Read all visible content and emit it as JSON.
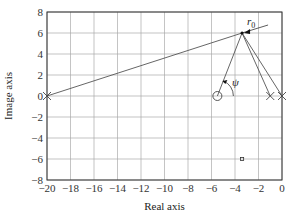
{
  "chart_data": {
    "type": "scatter",
    "title": "",
    "xlabel": "Real axis",
    "ylabel": "Image axis",
    "xlim": [
      -20,
      0
    ],
    "ylim": [
      -8,
      8
    ],
    "grid": true,
    "x_ticks": [
      "-20",
      "-18",
      "-16",
      "-14",
      "-12",
      "-10",
      "-8",
      "-6",
      "-4",
      "-2",
      "0"
    ],
    "y_ticks": [
      "8",
      "6",
      "4",
      "2",
      "0",
      "-2",
      "-4",
      "-6",
      "-8"
    ],
    "poles": [
      {
        "x": -20,
        "y": 0
      },
      {
        "x": -1,
        "y": 0
      },
      {
        "x": 0,
        "y": 0
      }
    ],
    "zeros": [
      {
        "x": -5.5,
        "y": 0
      }
    ],
    "test_point": {
      "x": -3.4,
      "y": 6,
      "label": "r0"
    },
    "conjugate_point": {
      "x": -3.4,
      "y": -6
    },
    "angle_label": "ψ",
    "vectors_from": [
      {
        "x": -20,
        "y": 0
      },
      {
        "x": -5.5,
        "y": 0
      },
      {
        "x": -1,
        "y": 0
      },
      {
        "x": 0,
        "y": 0
      }
    ]
  },
  "labels": {
    "r0_main": "r",
    "r0_sub": "0",
    "psi": "ψ"
  }
}
